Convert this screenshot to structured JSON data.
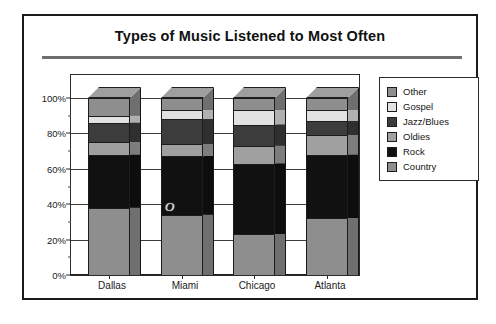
{
  "chart_data": {
    "type": "bar",
    "subtype": "stacked-100-percent-3d",
    "title": "Types of Music Listened to Most Often",
    "xlabel": "",
    "ylabel": "",
    "ylim": [
      0,
      100
    ],
    "ytick_labels": [
      "0%",
      "20%",
      "40%",
      "60%",
      "80%",
      "100%"
    ],
    "ytick_values": [
      0,
      20,
      40,
      60,
      80,
      100
    ],
    "yminor_values": [
      10,
      30,
      50,
      70,
      90
    ],
    "grid": true,
    "legend_position": "right",
    "categories": [
      "Dallas",
      "Miami",
      "Chicago",
      "Atlanta"
    ],
    "series": [
      {
        "name": "Country",
        "color": "#8e8e8e",
        "values": [
          38,
          34,
          23,
          32
        ]
      },
      {
        "name": "Rock",
        "color": "#111111",
        "values": [
          30,
          33,
          40,
          36
        ]
      },
      {
        "name": "Oldies",
        "color": "#a0a0a0",
        "values": [
          7,
          7,
          10,
          11
        ]
      },
      {
        "name": "Jazz/Blues",
        "color": "#3c3c3c",
        "values": [
          11,
          14,
          12,
          8
        ]
      },
      {
        "name": "Gospel",
        "color": "#e2e2e2",
        "values": [
          4,
          5,
          8,
          6
        ]
      },
      {
        "name": "Other",
        "color": "#8e8e8e",
        "values": [
          10,
          7,
          7,
          7
        ]
      }
    ],
    "legend_order": [
      "Other",
      "Gospel",
      "Jazz/Blues",
      "Oldies",
      "Rock",
      "Country"
    ],
    "annotations": [
      {
        "text": "O",
        "category": "Miami",
        "value": 38
      }
    ]
  },
  "legend": {
    "items": [
      {
        "label": "Other",
        "color": "#8e8e8e"
      },
      {
        "label": "Gospel",
        "color": "#e2e2e2"
      },
      {
        "label": "Jazz/Blues",
        "color": "#3c3c3c"
      },
      {
        "label": "Oldies",
        "color": "#a0a0a0"
      },
      {
        "label": "Rock",
        "color": "#111111"
      },
      {
        "label": "Country",
        "color": "#8e8e8e"
      }
    ]
  },
  "colors": {
    "frame": "#1a1a1a",
    "title_rule": "#6e6e6e",
    "axis": "#2b2b2b",
    "background": "#ffffff"
  }
}
